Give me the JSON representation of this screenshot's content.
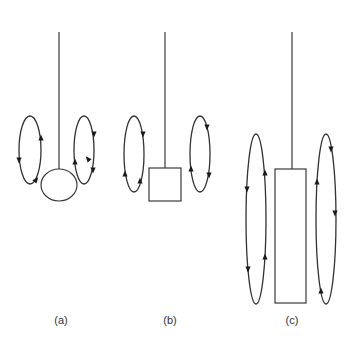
{
  "figure": {
    "colors": {
      "background": "#ffffff",
      "line": "#3a3a3a",
      "arrow": "#1a1a1a"
    },
    "panels": [
      {
        "label": "(a)",
        "body_shape": "ellipse",
        "string": {
          "x": 59,
          "y1": 32,
          "y2": 169
        },
        "body": {
          "cx": 59,
          "cy": 185,
          "rx": 18,
          "ry": 16
        },
        "loops": [
          {
            "side": "left",
            "cx": 30,
            "cy": 150,
            "rx": 11,
            "ry": 34,
            "arrows": [
              {
                "x": 41,
                "y": 138,
                "dir": "up"
              },
              {
                "x": 19,
                "y": 160,
                "dir": "down"
              },
              {
                "x": 36,
                "y": 180,
                "dir": "up-right"
              }
            ]
          },
          {
            "side": "right",
            "cx": 84,
            "cy": 150,
            "rx": 10,
            "ry": 34,
            "arrows": [
              {
                "x": 94,
                "y": 134,
                "dir": "down"
              },
              {
                "x": 75,
                "y": 162,
                "dir": "up"
              },
              {
                "x": 93,
                "y": 170,
                "dir": "down"
              },
              {
                "x": 88,
                "y": 159,
                "dir": "up-left"
              }
            ]
          }
        ],
        "label_pos": {
          "x": 61,
          "y": 322
        }
      },
      {
        "label": "(b)",
        "body_shape": "square",
        "string": {
          "x": 165,
          "y1": 32,
          "y2": 168
        },
        "body": {
          "x": 149,
          "y": 168,
          "w": 32,
          "h": 33
        },
        "loops": [
          {
            "side": "left",
            "cx": 134,
            "cy": 154,
            "rx": 10,
            "ry": 38,
            "arrows": [
              {
                "x": 143,
                "y": 134,
                "dir": "down"
              },
              {
                "x": 125,
                "y": 174,
                "dir": "up"
              },
              {
                "x": 140,
                "y": 181,
                "dir": "up"
              }
            ]
          },
          {
            "side": "right",
            "cx": 200,
            "cy": 154,
            "rx": 10,
            "ry": 38,
            "arrows": [
              {
                "x": 207,
                "y": 127,
                "dir": "down"
              },
              {
                "x": 191,
                "y": 169,
                "dir": "up"
              },
              {
                "x": 209,
                "y": 175,
                "dir": "down"
              }
            ]
          }
        ],
        "label_pos": {
          "x": 170,
          "y": 322
        }
      },
      {
        "label": "(c)",
        "body_shape": "tall-rectangle",
        "string": {
          "x": 292,
          "y1": 32,
          "y2": 169
        },
        "body": {
          "x": 275,
          "y": 169,
          "w": 31,
          "h": 134
        },
        "loops": [
          {
            "side": "left",
            "cx": 256,
            "cy": 219,
            "rx": 10,
            "ry": 85,
            "arrows": [
              {
                "x": 265,
                "y": 173,
                "dir": "up"
              },
              {
                "x": 247,
                "y": 189,
                "dir": "down"
              },
              {
                "x": 265,
                "y": 257,
                "dir": "up"
              },
              {
                "x": 248,
                "y": 269,
                "dir": "down"
              }
            ]
          },
          {
            "side": "right",
            "cx": 326,
            "cy": 219,
            "rx": 10,
            "ry": 85,
            "arrows": [
              {
                "x": 331,
                "y": 149,
                "dir": "down"
              },
              {
                "x": 317,
                "y": 182,
                "dir": "up"
              },
              {
                "x": 335,
                "y": 213,
                "dir": "down"
              },
              {
                "x": 321,
                "y": 291,
                "dir": "up"
              }
            ]
          }
        ],
        "label_pos": {
          "x": 292,
          "y": 322
        }
      }
    ]
  }
}
